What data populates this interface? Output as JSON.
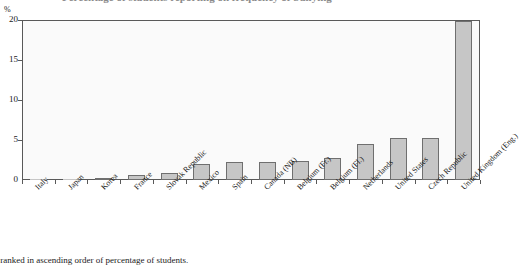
{
  "figure": {
    "title_clipped": "Percentage of students reporting on frequency of bullying",
    "y_unit_label": "%",
    "footnote": "re ranked in ascending order of percentage of students."
  },
  "chart_data": {
    "type": "bar",
    "title": "",
    "xlabel": "",
    "ylabel": "%",
    "ylim": [
      0,
      20
    ],
    "yticks": [
      0,
      5,
      10,
      15,
      20
    ],
    "ytick_labels": [
      "0",
      "5",
      "10",
      "15",
      "20"
    ],
    "grid": false,
    "legend": "none",
    "categories": [
      "Italy",
      "Japan",
      "Korea",
      "France",
      "Slovak Republic",
      "Mexico",
      "Spain",
      "Canada (NB)",
      "Belgium (Fr.)",
      "Belgium (Fl.)",
      "Netherlands",
      "United States",
      "Czech Republic",
      "United Kingdom (Eng.)"
    ],
    "values": [
      0.1,
      0.1,
      0.3,
      0.6,
      0.9,
      2.0,
      2.3,
      2.3,
      2.4,
      2.8,
      4.5,
      5.2,
      5.3,
      19.9
    ],
    "bar_color": "#c6c6c6",
    "bar_edge_color": "#6f6f6f",
    "note": "Countries are ranked in ascending order of percentage of students."
  }
}
